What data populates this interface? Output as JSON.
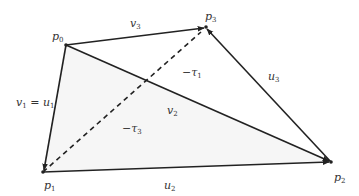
{
  "colors": {
    "stroke": "#222222",
    "fill": "#f6f6f6",
    "label": "#333333",
    "background": "#ffffff"
  },
  "points": {
    "p0": {
      "x": 66,
      "y": 45,
      "label": "p",
      "sub": "0"
    },
    "p1": {
      "x": 43,
      "y": 172,
      "label": "p",
      "sub": "1"
    },
    "p2": {
      "x": 331,
      "y": 162,
      "label": "p",
      "sub": "2"
    },
    "p3": {
      "x": 206,
      "y": 27,
      "label": "p",
      "sub": "3"
    }
  },
  "labels": {
    "p0": {
      "base": "p",
      "sub": "0"
    },
    "p1": {
      "base": "p",
      "sub": "1"
    },
    "p2": {
      "base": "p",
      "sub": "2"
    },
    "p3": {
      "base": "p",
      "sub": "3"
    },
    "v3": {
      "base": "v",
      "sub": "3"
    },
    "u3": {
      "base": "u",
      "sub": "3"
    },
    "v2": {
      "base": "v",
      "sub": "2"
    },
    "u2": {
      "base": "u",
      "sub": "2"
    },
    "v1": {
      "base": "v",
      "sub": "1"
    },
    "eq": "=",
    "u1": {
      "base": "u",
      "sub": "1"
    },
    "tau1": {
      "prefix": "−τ",
      "sub": "1"
    },
    "tau3": {
      "prefix": "−τ",
      "sub": "3"
    }
  },
  "edges": [
    {
      "name": "v3",
      "from": "p0",
      "to": "p3",
      "style": "solid"
    },
    {
      "name": "v2",
      "from": "p0",
      "to": "p2",
      "style": "solid"
    },
    {
      "name": "v1=u1",
      "from": "p0",
      "to": "p1",
      "style": "solid"
    },
    {
      "name": "u2",
      "from": "p1",
      "to": "p2",
      "style": "solid"
    },
    {
      "name": "u3",
      "from": "p2",
      "to": "p3",
      "style": "solid"
    },
    {
      "name": "p1-p3",
      "from": "p1",
      "to": "p3",
      "style": "dashed"
    }
  ],
  "shaded_face": [
    "p0",
    "p1",
    "p2"
  ]
}
